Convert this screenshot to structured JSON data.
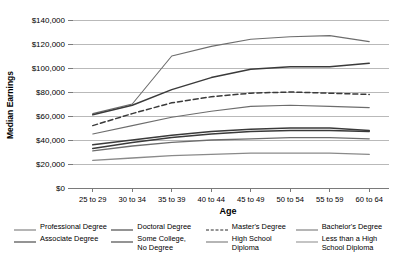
{
  "chart_data": {
    "type": "line",
    "title": "",
    "xlabel": "Age",
    "ylabel": "Median Earnings",
    "categories": [
      "25 to 29",
      "30 to 34",
      "35 to 39",
      "40 to 44",
      "45 to 49",
      "50 to 54",
      "55 to 59",
      "60 to 64"
    ],
    "ylim": [
      0,
      140000
    ],
    "ytick_values": [
      0,
      20000,
      40000,
      60000,
      80000,
      100000,
      120000,
      140000
    ],
    "ytick_labels": [
      "$0",
      "$20,000",
      "$40,000",
      "$60,000",
      "$80,000",
      "$100,000",
      "$120,000",
      "$140,000"
    ],
    "grid": true,
    "legend_position": "bottom",
    "series": [
      {
        "name": "Professional Degree",
        "style": "solid",
        "color": "#6d6d6d",
        "width": 1.1,
        "values": [
          62000,
          70000,
          110000,
          118000,
          124000,
          126000,
          127000,
          122000
        ]
      },
      {
        "name": "Doctoral Degree",
        "style": "solid",
        "color": "#3a3a3a",
        "width": 1.5,
        "values": [
          61000,
          69000,
          82000,
          92000,
          99000,
          101000,
          101000,
          104000
        ]
      },
      {
        "name": "Master's Degree",
        "style": "dashed",
        "color": "#3a3a3a",
        "width": 1.5,
        "values": [
          52000,
          62000,
          71000,
          76000,
          79000,
          80000,
          79000,
          78000
        ]
      },
      {
        "name": "Bachelor's Degree",
        "style": "solid",
        "color": "#6d6d6d",
        "width": 1.1,
        "values": [
          45000,
          52000,
          59000,
          64000,
          68000,
          69000,
          68000,
          67000
        ]
      },
      {
        "name": "Associate Degree",
        "style": "solid",
        "color": "#3a3a3a",
        "width": 1.5,
        "values": [
          36000,
          40000,
          44000,
          47000,
          49000,
          50000,
          50000,
          48000
        ]
      },
      {
        "name": "Some College, No Degree",
        "style": "solid",
        "color": "#3a3a3a",
        "width": 1.5,
        "values": [
          33000,
          38000,
          42000,
          45000,
          47000,
          48000,
          48000,
          47000
        ]
      },
      {
        "name": "High School Diploma",
        "style": "solid",
        "color": "#6d6d6d",
        "width": 1.3,
        "values": [
          31000,
          35000,
          38000,
          40000,
          41000,
          42000,
          42000,
          41000
        ]
      },
      {
        "name": "Less than a High School Diploma",
        "style": "solid",
        "color": "#8a8a8a",
        "width": 1.3,
        "values": [
          23000,
          25000,
          27000,
          28000,
          29000,
          29000,
          29000,
          28000
        ]
      }
    ]
  },
  "axes": {
    "ylabel": "Median Earnings",
    "xlabel": "Age"
  },
  "legend": {
    "row1": [
      {
        "label": "Professional Degree",
        "style": "solid",
        "color": "#6d6d6d",
        "width": 1.2
      },
      {
        "label": "Doctoral Degree",
        "style": "solid",
        "color": "#2a2a2a",
        "width": 1.8
      },
      {
        "label": "Master's Degree",
        "style": "dashed",
        "color": "#2a2a2a",
        "width": 1.6
      },
      {
        "label": "Bachelor's Degree",
        "style": "solid",
        "color": "#6d6d6d",
        "width": 1.2
      }
    ],
    "row2": [
      {
        "label": "Associate Degree",
        "style": "solid",
        "color": "#2a2a2a",
        "width": 1.8
      },
      {
        "label": "Some College,\nNo Degree",
        "style": "solid",
        "color": "#2a2a2a",
        "width": 1.8
      },
      {
        "label": "High School\nDiploma",
        "style": "solid",
        "color": "#6d6d6d",
        "width": 1.4
      },
      {
        "label": "Less than a High\nSchool Diploma",
        "style": "solid",
        "color": "#8a8a8a",
        "width": 1.4
      }
    ]
  }
}
